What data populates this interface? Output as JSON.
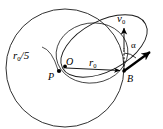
{
  "figure": {
    "background_color": "#ffffff",
    "stroke_color": "#1a1a1a",
    "width": 163,
    "height": 129
  },
  "labels": {
    "radius_small": "r",
    "radius_small_sub": "0",
    "radius_small_suffix": "/5",
    "center": "O",
    "periapsis": "P",
    "burn_point": "B",
    "radius": "r",
    "radius_sub": "0",
    "velocity": "v",
    "velocity_sub": "0",
    "angle": "α"
  },
  "geometry": {
    "point_O": {
      "x": 65,
      "y": 66
    },
    "point_P": {
      "x": 58.5,
      "y": 71.5
    },
    "point_B": {
      "x": 124,
      "y": 71
    },
    "radius_vector": {
      "from": "O",
      "to": "B",
      "label": "r0"
    },
    "velocity_vector": {
      "from": "B",
      "direction": "up",
      "label": "v0"
    },
    "thrust_vector": {
      "from": "B",
      "direction": "up-right",
      "angle_label": "alpha"
    },
    "circle_large": {
      "cx": 65,
      "cy": 68,
      "r": 59
    },
    "ellipse_tilted": {
      "cx": 104,
      "cy": 46,
      "rx": 46,
      "ry": 26,
      "rotation_deg": -28
    },
    "ellipse_inner": {
      "cx": 92,
      "cy": 56,
      "rx": 35,
      "ry": 28,
      "rotation_deg": -12
    }
  },
  "icons": {
    "arrowhead": "arrowhead-icon",
    "dot_marker": "dot-marker-icon",
    "dashed_reference": "dashed-reference-line-icon"
  }
}
